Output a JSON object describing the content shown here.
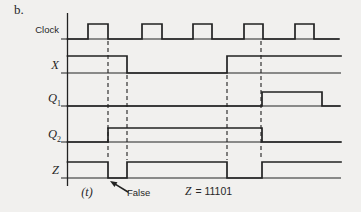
{
  "figure_label": "b.",
  "colors": {
    "background": "#f1f0ee",
    "ink": "#222222",
    "text": "#262626"
  },
  "diagram": {
    "type": "digital-timing-diagram",
    "signals": [
      {
        "id": "clock",
        "label": "Clock",
        "sub": "",
        "base_y": 39,
        "high_y": 24,
        "x_start": 61,
        "x_end": 339,
        "initial": 0,
        "transitions": [
          [
            88,
            1
          ],
          [
            108,
            0
          ],
          [
            142,
            1
          ],
          [
            162,
            0
          ],
          [
            193,
            1
          ],
          [
            212,
            0
          ],
          [
            244,
            1
          ],
          [
            263,
            0
          ],
          [
            295,
            1
          ],
          [
            314,
            0
          ]
        ]
      },
      {
        "id": "x",
        "label": "X",
        "sub": "",
        "base_y": 73,
        "high_y": 56,
        "x_start": 61,
        "x_end": 341,
        "initial": 1,
        "transitions": [
          [
            127,
            0
          ],
          [
            227,
            1
          ]
        ]
      },
      {
        "id": "q1",
        "label": "Q",
        "sub": "1",
        "base_y": 106,
        "high_y": 92,
        "x_start": 61,
        "x_end": 340,
        "initial": 0,
        "transitions": [
          [
            262,
            1
          ],
          [
            322,
            0
          ]
        ]
      },
      {
        "id": "q2",
        "label": "Q",
        "sub": "2",
        "base_y": 142,
        "high_y": 128,
        "x_start": 61,
        "x_end": 341,
        "initial": 0,
        "transitions": [
          [
            108,
            1
          ],
          [
            262,
            0
          ]
        ]
      },
      {
        "id": "z",
        "label": "Z",
        "sub": "",
        "base_y": 178,
        "high_y": 162,
        "x_start": 61,
        "x_end": 341,
        "initial": 1,
        "transitions": [
          [
            108,
            0
          ],
          [
            127,
            1
          ],
          [
            227,
            0
          ],
          [
            262,
            1
          ]
        ]
      }
    ],
    "time_axis": {
      "x": 67.5,
      "y_top": 13,
      "y_bottom": 186
    },
    "dashed_lines": [
      {
        "x": 108,
        "y1": 41,
        "y2": 160
      },
      {
        "x": 127,
        "y1": 75,
        "y2": 160
      },
      {
        "x": 227,
        "y1": 75,
        "y2": 160
      },
      {
        "x": 261,
        "y1": 41,
        "y2": 160
      }
    ],
    "annotations": {
      "t_label": "(t)",
      "false_label": "False",
      "z_var": "Z",
      "z_value": "= 11101"
    },
    "arrow": {
      "tip": [
        110,
        181
      ],
      "tail": [
        128,
        192
      ]
    }
  }
}
